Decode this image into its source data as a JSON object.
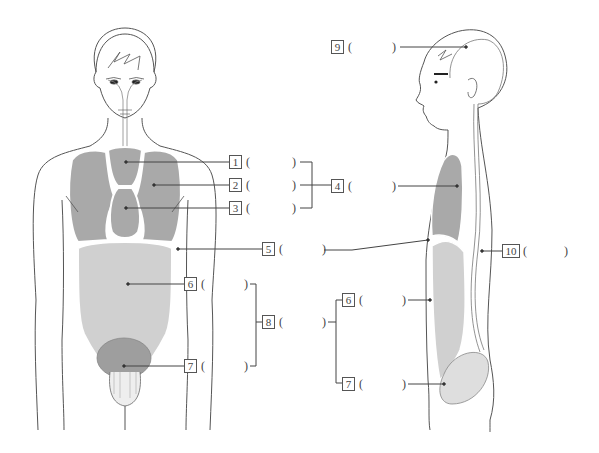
{
  "diagram": {
    "type": "anatomy-labeling-worksheet",
    "views": [
      "front-view-body",
      "side-view-body"
    ],
    "colors": {
      "outline": "#555555",
      "chest_organ_fill": "#a9a9a9",
      "abdominal_fill": "#d0d0d0",
      "pelvic_fill": "#9e9e9e",
      "side_pelvic_fill": "#dedede",
      "leader_line": "#444444"
    }
  },
  "labels": [
    {
      "number": "1",
      "open": "(",
      "close": ")",
      "answer": ""
    },
    {
      "number": "2",
      "open": "(",
      "close": ")",
      "answer": ""
    },
    {
      "number": "3",
      "open": "(",
      "close": ")",
      "answer": ""
    },
    {
      "number": "4",
      "open": "(",
      "close": ")",
      "answer": ""
    },
    {
      "number": "5",
      "open": "(",
      "close": ")",
      "answer": ""
    },
    {
      "number": "6",
      "open": "(",
      "close": ")",
      "answer": ""
    },
    {
      "number": "7",
      "open": "(",
      "close": ")",
      "answer": ""
    },
    {
      "number": "8",
      "open": "(",
      "close": ")",
      "answer": ""
    },
    {
      "number": "9",
      "open": "(",
      "close": ")",
      "answer": ""
    },
    {
      "number": "10",
      "open": "(",
      "close": ")",
      "answer": ""
    },
    {
      "number": "6",
      "open": "(",
      "close": ")",
      "answer": ""
    },
    {
      "number": "7",
      "open": "(",
      "close": ")",
      "answer": ""
    }
  ]
}
